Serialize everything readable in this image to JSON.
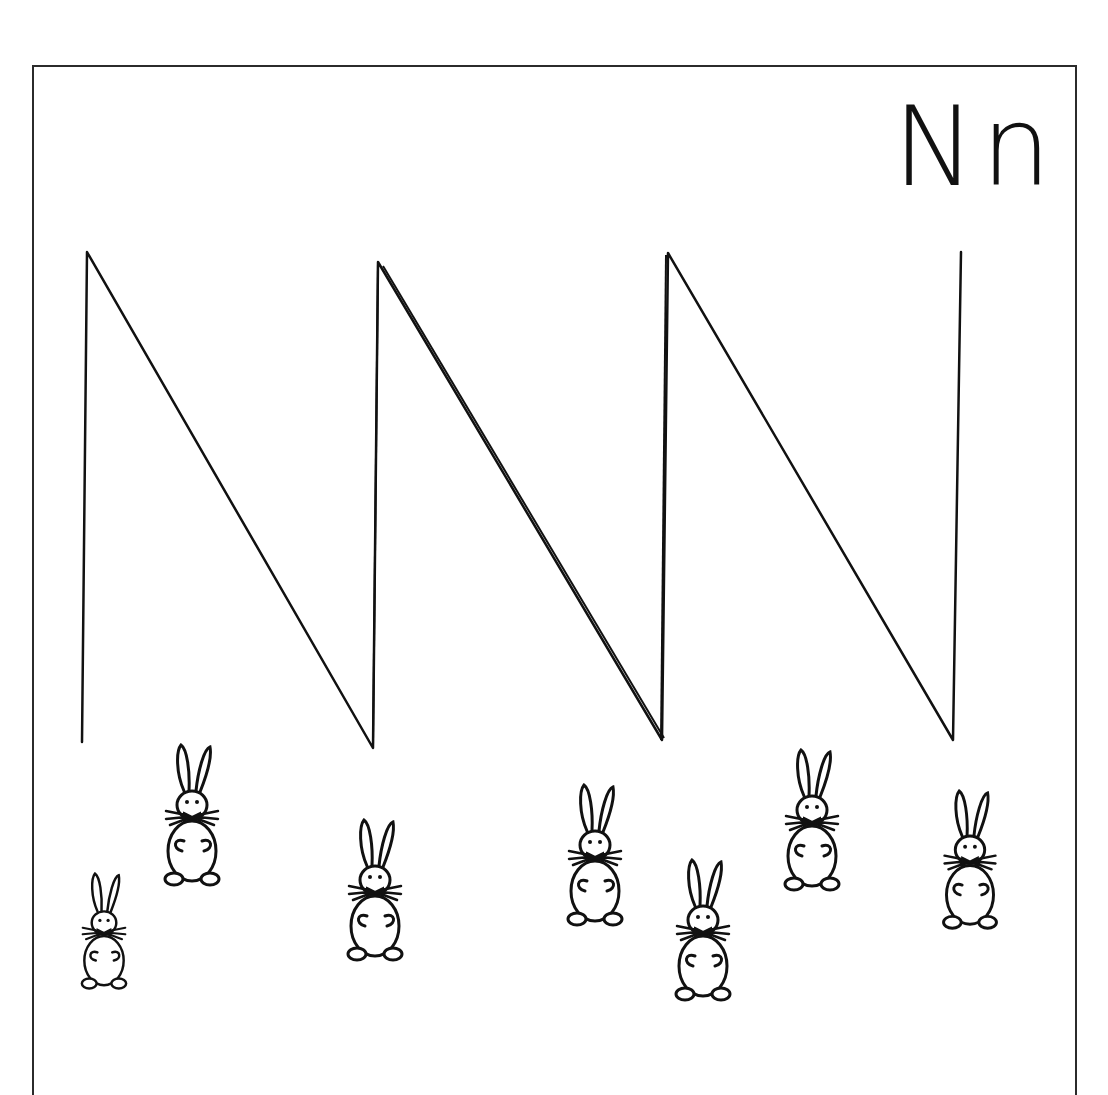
{
  "worksheet": {
    "letter_label": "Nn",
    "letter": "N",
    "stroke_color": "#111111",
    "border_color": "#2b2b2b",
    "zigzag_points": [
      [
        82,
        742
      ],
      [
        87,
        252
      ],
      [
        373,
        748
      ],
      [
        378,
        262
      ],
      [
        662,
        740
      ],
      [
        668,
        253
      ],
      [
        953,
        740
      ],
      [
        961,
        252
      ]
    ],
    "bunnies": [
      {
        "name": "bunny-1",
        "x": 104,
        "y": 865,
        "scale": 0.82
      },
      {
        "name": "bunny-2",
        "x": 192,
        "y": 745,
        "scale": 1.0
      },
      {
        "name": "bunny-3",
        "x": 375,
        "y": 820,
        "scale": 1.0
      },
      {
        "name": "bunny-4",
        "x": 595,
        "y": 785,
        "scale": 1.0
      },
      {
        "name": "bunny-5",
        "x": 703,
        "y": 860,
        "scale": 1.0
      },
      {
        "name": "bunny-6",
        "x": 812,
        "y": 750,
        "scale": 1.0
      },
      {
        "name": "bunny-7",
        "x": 970,
        "y": 790,
        "scale": 0.98
      }
    ]
  }
}
